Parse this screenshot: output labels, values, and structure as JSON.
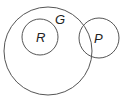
{
  "diagram": {
    "type": "venn",
    "stroke_color": "#555555",
    "circles": [
      {
        "label": "G",
        "cx": 48,
        "cy": 51,
        "r": 44,
        "label_x": 55,
        "label_y": 24
      },
      {
        "label": "R",
        "cx": 40,
        "cy": 37,
        "r": 18,
        "label_x": 36,
        "label_y": 42
      },
      {
        "label": "P",
        "cx": 99,
        "cy": 38,
        "r": 20,
        "label_x": 94,
        "label_y": 43
      }
    ]
  }
}
